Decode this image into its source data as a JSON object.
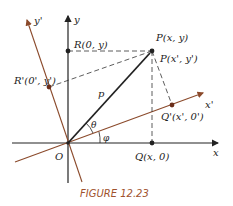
{
  "figure": {
    "caption": "FIGURE 12.23",
    "colors": {
      "axes": "#222222",
      "rotated_axes": "#8b4a2b",
      "caption": "#a0522d",
      "dashed": "#333333"
    },
    "axes": {
      "x_label": "x",
      "y_label": "y",
      "x_prime_label": "x'",
      "y_prime_label": "y'",
      "origin_label": "O"
    },
    "points": {
      "P": "P(x, y)",
      "P_prime": "P(x', y')",
      "R": "R(0, y)",
      "R_prime": "R'(0', y')",
      "Q": "Q(x, 0)",
      "Q_prime": "Q'(x', 0')"
    },
    "vector_label": "p",
    "angles": {
      "theta": "θ",
      "phi": "φ"
    }
  }
}
